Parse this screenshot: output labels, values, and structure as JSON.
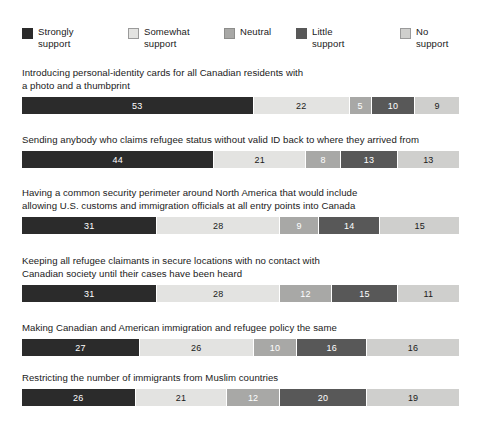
{
  "legend": {
    "items": [
      {
        "label": "Strongly\nsupport",
        "color": "#2b2b2b",
        "border": "#2b2b2b",
        "text_color": "#ffffff",
        "x": 0,
        "name": "strongly-support"
      },
      {
        "label": "Somewhat\nsupport",
        "color": "#e3e3e1",
        "border": "#9a9a9a",
        "text_color": "#1a1a1a",
        "x": 106,
        "name": "somewhat-support"
      },
      {
        "label": "Neutral",
        "color": "#a8a8a6",
        "border": "#8d8d8b",
        "text_color": "#ffffff",
        "x": 202,
        "name": "neutral"
      },
      {
        "label": "Little\nsupport",
        "color": "#585858",
        "border": "#585858",
        "text_color": "#ffffff",
        "x": 274,
        "name": "little-support"
      },
      {
        "label": "No support",
        "color": "#cfcfcd",
        "border": "#9a9a9a",
        "text_color": "#1a1a1a",
        "x": 378,
        "name": "no-support"
      }
    ]
  },
  "chart_data": {
    "type": "bar",
    "orientation": "horizontal",
    "stacked": true,
    "stacked_percent": true,
    "title": "",
    "xlabel": "",
    "ylabel": "",
    "xlim": [
      0,
      100
    ],
    "grid": false,
    "legend_position": "top",
    "series": [
      {
        "name": "Strongly support",
        "color": "#2b2b2b",
        "values": [
          53,
          44,
          31,
          31,
          27,
          26
        ]
      },
      {
        "name": "Somewhat support",
        "color": "#e3e3e1",
        "values": [
          22,
          21,
          28,
          28,
          26,
          21
        ]
      },
      {
        "name": "Neutral",
        "color": "#a8a8a6",
        "values": [
          5,
          8,
          9,
          12,
          10,
          12
        ]
      },
      {
        "name": "Little support",
        "color": "#585858",
        "values": [
          10,
          13,
          14,
          15,
          16,
          20
        ]
      },
      {
        "name": "No support",
        "color": "#cfcfcd",
        "values": [
          9,
          13,
          15,
          11,
          16,
          19
        ]
      }
    ],
    "categories": [
      "Introducing personal-identity cards for all Canadian residents with a photo and a thumbprint",
      "Sending anybody who claims refugee status without valid ID back to where they arrived from",
      "Having a common security perimeter around North America that would include allowing U.S. customs and immigration officials at all entry points into Canada",
      "Keeping all refugee claimants in secure locations with no contact with Canadian society until their cases have been heard",
      "Making Canadian and American immigration and refugee policy the same",
      "Restricting the number of immigrants from Muslim countries"
    ]
  },
  "groups": [
    {
      "name": "identity-cards",
      "top": 66,
      "question": "Introducing personal-identity cards for all Canadian residents with\na photo and a thumbprint",
      "segments": [
        {
          "value": "53",
          "color": "#2b2b2b",
          "text_color": "#ffffff",
          "pct": 53
        },
        {
          "value": "22",
          "color": "#e3e3e1",
          "text_color": "#1a1a1a",
          "pct": 22
        },
        {
          "value": "5",
          "color": "#a8a8a6",
          "text_color": "#ffffff",
          "pct": 5
        },
        {
          "value": "10",
          "color": "#585858",
          "text_color": "#ffffff",
          "pct": 10
        },
        {
          "value": "9",
          "color": "#cfcfcd",
          "text_color": "#1a1a1a",
          "pct": 10
        }
      ]
    },
    {
      "name": "refugee-no-valid-id",
      "top": 133,
      "question": "Sending anybody who claims refugee status without valid ID back to where they arrived from",
      "segments": [
        {
          "value": "44",
          "color": "#2b2b2b",
          "text_color": "#ffffff",
          "pct": 44
        },
        {
          "value": "21",
          "color": "#e3e3e1",
          "text_color": "#1a1a1a",
          "pct": 21
        },
        {
          "value": "8",
          "color": "#a8a8a6",
          "text_color": "#ffffff",
          "pct": 8
        },
        {
          "value": "13",
          "color": "#585858",
          "text_color": "#ffffff",
          "pct": 13
        },
        {
          "value": "13",
          "color": "#cfcfcd",
          "text_color": "#1a1a1a",
          "pct": 14
        }
      ]
    },
    {
      "name": "security-perimeter",
      "top": 186,
      "question": "Having a common security perimeter around North America that would include\nallowing U.S. customs and immigration officials at all entry points into Canada",
      "segments": [
        {
          "value": "31",
          "color": "#2b2b2b",
          "text_color": "#ffffff",
          "pct": 31
        },
        {
          "value": "28",
          "color": "#e3e3e1",
          "text_color": "#1a1a1a",
          "pct": 28
        },
        {
          "value": "9",
          "color": "#a8a8a6",
          "text_color": "#ffffff",
          "pct": 9
        },
        {
          "value": "14",
          "color": "#585858",
          "text_color": "#ffffff",
          "pct": 14
        },
        {
          "value": "15",
          "color": "#cfcfcd",
          "text_color": "#1a1a1a",
          "pct": 18
        }
      ]
    },
    {
      "name": "secure-locations",
      "top": 254,
      "question": "Keeping all refugee claimants in secure locations with no contact with\nCanadian society until their cases have been heard",
      "segments": [
        {
          "value": "31",
          "color": "#2b2b2b",
          "text_color": "#ffffff",
          "pct": 31
        },
        {
          "value": "28",
          "color": "#e3e3e1",
          "text_color": "#1a1a1a",
          "pct": 28
        },
        {
          "value": "12",
          "color": "#a8a8a6",
          "text_color": "#ffffff",
          "pct": 12
        },
        {
          "value": "15",
          "color": "#585858",
          "text_color": "#ffffff",
          "pct": 15
        },
        {
          "value": "11",
          "color": "#cfcfcd",
          "text_color": "#1a1a1a",
          "pct": 14
        }
      ]
    },
    {
      "name": "same-policy",
      "top": 321,
      "question": "Making Canadian and American immigration and refugee policy the same",
      "segments": [
        {
          "value": "27",
          "color": "#2b2b2b",
          "text_color": "#ffffff",
          "pct": 27
        },
        {
          "value": "26",
          "color": "#e3e3e1",
          "text_color": "#1a1a1a",
          "pct": 26
        },
        {
          "value": "10",
          "color": "#a8a8a6",
          "text_color": "#ffffff",
          "pct": 10
        },
        {
          "value": "16",
          "color": "#585858",
          "text_color": "#ffffff",
          "pct": 16
        },
        {
          "value": "16",
          "color": "#cfcfcd",
          "text_color": "#1a1a1a",
          "pct": 21
        }
      ]
    },
    {
      "name": "muslim-countries",
      "top": 371,
      "question": "Restricting the number of immigrants from Muslim countries",
      "segments": [
        {
          "value": "26",
          "color": "#2b2b2b",
          "text_color": "#ffffff",
          "pct": 26
        },
        {
          "value": "21",
          "color": "#e3e3e1",
          "text_color": "#1a1a1a",
          "pct": 21
        },
        {
          "value": "12",
          "color": "#a8a8a6",
          "text_color": "#ffffff",
          "pct": 12
        },
        {
          "value": "20",
          "color": "#585858",
          "text_color": "#ffffff",
          "pct": 20
        },
        {
          "value": "19",
          "color": "#cfcfcd",
          "text_color": "#1a1a1a",
          "pct": 21
        }
      ]
    }
  ]
}
